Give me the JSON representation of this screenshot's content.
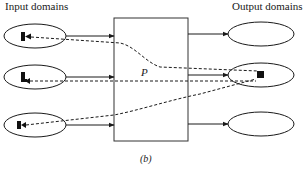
{
  "diagram": {
    "input_title": "Input domains",
    "output_title": "Output domains",
    "process_label": "P",
    "caption": "(b)",
    "inputs": [
      {
        "id": "input-1",
        "marker": "filled-shape"
      },
      {
        "id": "input-2",
        "marker": "filled-shape"
      },
      {
        "id": "input-3",
        "marker": "filled-shape"
      }
    ],
    "outputs": [
      {
        "id": "output-1",
        "marker": "none"
      },
      {
        "id": "output-2",
        "marker": "filled-square"
      },
      {
        "id": "output-3",
        "marker": "none"
      }
    ],
    "mappings": [
      {
        "from": "input-1",
        "to": "output-2",
        "style": "dashed"
      },
      {
        "from": "input-2",
        "to": "output-2",
        "style": "dashed"
      },
      {
        "from": "input-3",
        "to": "output-2",
        "style": "dashed"
      }
    ],
    "colors": {
      "stroke": "#1a1a1a",
      "background": "#ffffff"
    }
  }
}
